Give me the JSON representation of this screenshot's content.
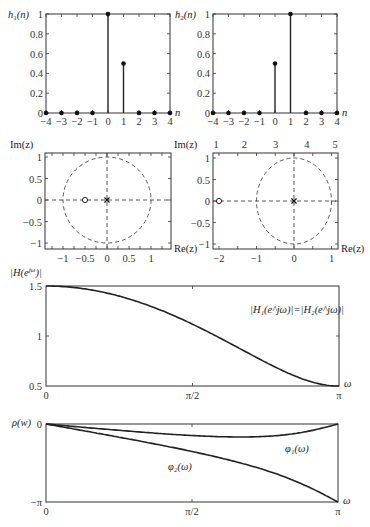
{
  "chart_data": [
    {
      "id": "h1",
      "type": "stem",
      "ylabel": "h1(n)",
      "xlabel": "n",
      "x": [
        -4,
        -3,
        -2,
        -1,
        0,
        1,
        2,
        3,
        4
      ],
      "values": [
        0,
        0,
        0,
        0,
        1,
        0.5,
        0,
        0,
        0
      ],
      "xlim": [
        -4,
        4
      ],
      "ylim": [
        0,
        1
      ],
      "yticks": [
        "0",
        "0.2",
        "0.4",
        "0.6",
        "0.8",
        "1"
      ],
      "xticks": [
        "−4",
        "−3",
        "−2",
        "−1",
        "0",
        "1",
        "2",
        "3",
        "4"
      ]
    },
    {
      "id": "h2",
      "type": "stem",
      "ylabel": "h2(n)",
      "xlabel": "n",
      "x": [
        -4,
        -3,
        -2,
        -1,
        0,
        1,
        2,
        3,
        4
      ],
      "values": [
        0,
        0,
        0,
        0,
        0.5,
        1,
        0,
        0,
        0
      ],
      "xlim": [
        -4,
        4
      ],
      "ylim": [
        0,
        1
      ],
      "yticks": [
        "0",
        "0.2",
        "0.4",
        "0.6",
        "0.8",
        "1"
      ],
      "xticks": [
        "−4",
        "−3",
        "−2",
        "−1",
        "0",
        "1",
        "2",
        "3",
        "4"
      ]
    },
    {
      "id": "pz1",
      "type": "scatter",
      "title": "Pole-zero plot of H1(z)",
      "ylabel": "Im(z)",
      "xlabel": "Re(z)",
      "zeros": [
        [
          -0.5,
          0
        ]
      ],
      "poles": [
        [
          0,
          0
        ]
      ],
      "unit_circle": true,
      "xlim": [
        -1.45,
        1.45
      ],
      "ylim": [
        -1.1,
        1.1
      ],
      "xticks": [
        "−1",
        "−0.5",
        "0",
        "0.5",
        "1"
      ],
      "yticks": [
        "−1",
        "−0.5",
        "0",
        "0.5",
        "1"
      ]
    },
    {
      "id": "pz2",
      "type": "scatter",
      "title": "Pole-zero plot of H2(z)",
      "ylabel": "Im(z)",
      "xlabel": "Re(z)",
      "zeros": [
        [
          -2,
          0
        ]
      ],
      "poles": [
        [
          0,
          0
        ]
      ],
      "unit_circle": true,
      "xlim": [
        -2.1,
        1.1
      ],
      "ylim": [
        -1.1,
        1.1
      ],
      "xticks": [
        "−2",
        "−1",
        "0",
        "1"
      ],
      "yticks": [
        "−1",
        "−0.5",
        "0",
        "0.5",
        "1"
      ],
      "top_ticks": [
        "1",
        "2",
        "3",
        "4",
        "5"
      ]
    },
    {
      "id": "mag",
      "type": "line",
      "ylabel": "|H(e^jω)|",
      "xlabel": "ω",
      "annotation": "|H1(e^jω)|=|H2(e^jω)|",
      "x_range": [
        0,
        3.14159
      ],
      "ylim": [
        0.5,
        1.5
      ],
      "xticks": [
        "0",
        "π/2",
        "π"
      ],
      "yticks": [
        "0.5",
        "1",
        "1.5"
      ],
      "series": [
        {
          "name": "|H1|=|H2|",
          "x": [
            0,
            0.3927,
            0.7854,
            1.1781,
            1.5708,
            1.9635,
            2.3562,
            2.7489,
            3.1416
          ],
          "values": [
            1.5,
            1.4837,
            1.4367,
            1.3512,
            1.118,
            0.9619,
            0.7422,
            0.572,
            0.5
          ]
        }
      ]
    },
    {
      "id": "phase",
      "type": "line",
      "ylabel": "φ(w)",
      "xlabel": "ω",
      "x_range": [
        0,
        3.14159
      ],
      "ylim": [
        -3.14159,
        0
      ],
      "xticks": [
        "0",
        "π/2",
        "π"
      ],
      "yticks": [
        "−π",
        "0"
      ],
      "series": [
        {
          "name": "φ1(ω)",
          "x": [
            0,
            0.7854,
            1.5708,
            2.0944,
            2.3562,
            2.7489,
            3.1416
          ],
          "values": [
            0,
            -0.2739,
            -0.4636,
            -0.5236,
            -0.5049,
            -0.3616,
            0
          ]
        },
        {
          "name": "φ2(ω)",
          "x": [
            0,
            0.7854,
            1.5708,
            2.0944,
            2.3562,
            2.7489,
            3.1416
          ],
          "values": [
            0,
            -0.588,
            -1.1071,
            -1.5708,
            -1.8515,
            -2.3795,
            -3.1416
          ]
        }
      ]
    }
  ],
  "labels": {
    "h1_ylabel_main": "h",
    "h1_ylabel_sub": "1",
    "h1_ylabel_arg": "(n)",
    "h2_ylabel_main": "h",
    "h2_ylabel_sub": "2",
    "h2_ylabel_arg": "(n)",
    "n": "n",
    "im": "Im(z)",
    "re": "Re(z)",
    "mag_ylabel": "|H(e",
    "mag_ylabel_sup": "jω",
    "mag_ylabel_end": ")|",
    "mag_annot": "|H₁(e^jω)|=|H₂(e^jω)|",
    "omega": "ω",
    "phase_ylabel": "ρ(w)",
    "phi1": "φ₁(ω)",
    "phi2": "φ₂(ω)"
  }
}
